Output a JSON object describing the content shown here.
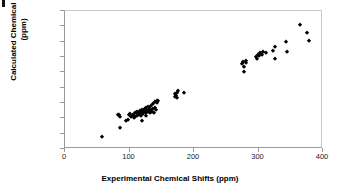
{
  "chart_data": {
    "type": "scatter",
    "title": "",
    "xlabel": "Experimental Chemical Shifts (ppm)",
    "ylabel_line1": "Calculated Chemical Shifts",
    "ylabel_line2": "(ppm)",
    "xlim": [
      0,
      400
    ],
    "ylim": [
      0,
      450
    ],
    "xticks": [
      "0",
      "100",
      "200",
      "300",
      "400"
    ],
    "xtick_values": [
      0,
      100,
      200,
      300,
      400
    ],
    "yticks": [
      "0.0",
      "50.0",
      "100.0",
      "150.0",
      "200.0",
      "250.0",
      "300.0",
      "350.0",
      "400.0",
      "450.0"
    ],
    "ytick_values": [
      0,
      50,
      100,
      150,
      200,
      250,
      300,
      350,
      400,
      450
    ],
    "grid": false,
    "legend": false,
    "marker": "diamond",
    "marker_color": "#000000",
    "series": [
      {
        "name": "Chemical shifts",
        "points": [
          [
            57,
            40
          ],
          [
            82,
            112
          ],
          [
            84,
            110
          ],
          [
            85,
            105
          ],
          [
            86,
            68
          ],
          [
            95,
            92
          ],
          [
            97,
            95
          ],
          [
            99,
            110
          ],
          [
            101,
            113
          ],
          [
            103,
            105
          ],
          [
            105,
            108
          ],
          [
            106,
            112
          ],
          [
            107,
            100
          ],
          [
            108,
            118
          ],
          [
            109,
            104
          ],
          [
            110,
            116
          ],
          [
            111,
            122
          ],
          [
            112,
            108
          ],
          [
            113,
            113
          ],
          [
            114,
            119
          ],
          [
            115,
            111
          ],
          [
            116,
            124
          ],
          [
            117,
            117
          ],
          [
            118,
            109
          ],
          [
            119,
            126
          ],
          [
            120,
            120
          ],
          [
            120,
            92
          ],
          [
            121,
            114
          ],
          [
            122,
            128
          ],
          [
            123,
            122
          ],
          [
            124,
            131
          ],
          [
            125,
            118
          ],
          [
            126,
            135
          ],
          [
            126,
            108
          ],
          [
            127,
            125
          ],
          [
            128,
            138
          ],
          [
            129,
            120
          ],
          [
            130,
            128
          ],
          [
            131,
            133
          ],
          [
            132,
            116
          ],
          [
            133,
            126
          ],
          [
            134,
            140
          ],
          [
            135,
            122
          ],
          [
            136,
            130
          ],
          [
            137,
            146
          ],
          [
            138,
            118
          ],
          [
            139,
            135
          ],
          [
            140,
            152
          ],
          [
            141,
            128
          ],
          [
            142,
            155
          ],
          [
            143,
            150
          ],
          [
            144,
            158
          ],
          [
            170,
            168
          ],
          [
            171,
            178
          ],
          [
            172,
            172
          ],
          [
            173,
            182
          ],
          [
            174,
            165
          ],
          [
            175,
            190
          ],
          [
            184,
            184
          ],
          [
            275,
            278
          ],
          [
            276,
            285
          ],
          [
            277,
            268
          ],
          [
            278,
            252
          ],
          [
            280,
            288
          ],
          [
            281,
            282
          ],
          [
            296,
            300
          ],
          [
            297,
            295
          ],
          [
            299,
            308
          ],
          [
            301,
            303
          ],
          [
            303,
            312
          ],
          [
            305,
            306
          ],
          [
            307,
            315
          ],
          [
            311,
            312
          ],
          [
            322,
            318
          ],
          [
            325,
            333
          ],
          [
            326,
            295
          ],
          [
            342,
            348
          ],
          [
            344,
            316
          ],
          [
            365,
            405
          ],
          [
            375,
            378
          ],
          [
            378,
            352
          ]
        ]
      }
    ]
  }
}
